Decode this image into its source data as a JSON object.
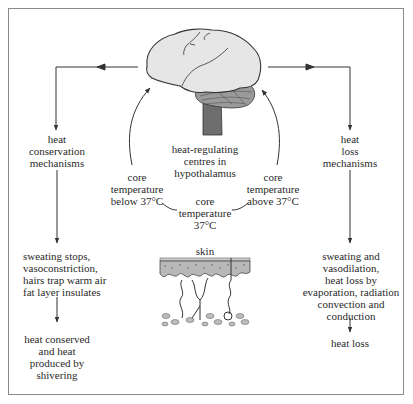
{
  "diagram": {
    "type": "flow",
    "topic": "thermoregulation",
    "center": {
      "image": "brain-illustration",
      "label": "heat-regulating\ncentres in\nhypothalamus"
    },
    "cycle_labels": {
      "below": "core\ntemperature\nbelow 37°C",
      "normal": "core\ntemperature\n37°C",
      "above": "core\ntemperature\nabove 37°C"
    },
    "left_branch": {
      "title": "heat\nconservation\nmechanisms",
      "effects": "sweating stops,\nvasoconstriction,\nhairs trap warm air\nfat layer insulates",
      "result": "heat conserved\nand heat\nproduced by\nshivering"
    },
    "right_branch": {
      "title": "heat\nloss\nmechanisms",
      "effects": "sweating and\nvasodilation,\nheat loss by\nevaporation, radiation\nconvection and\nconduction",
      "result": "heat loss"
    },
    "skin": {
      "label": "skin",
      "image": "skin-cross-section-illustration"
    },
    "colors": {
      "line": "#333333",
      "brain_fill": "#e6e6e6",
      "brainstem_fill": "#6e6e6e",
      "frame": "#8a8a8a"
    }
  }
}
